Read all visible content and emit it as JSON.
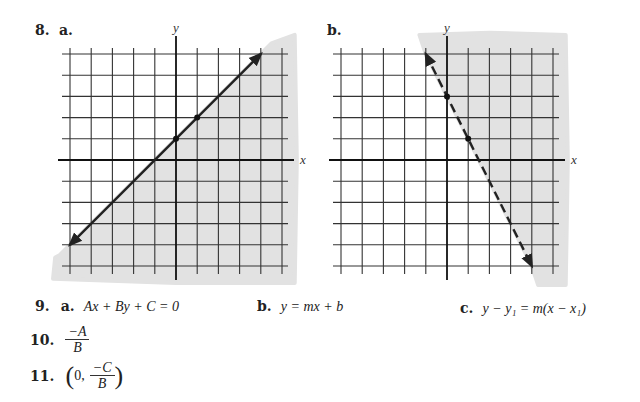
{
  "problem8": {
    "number": "8.",
    "graphs": [
      {
        "label": "a.",
        "x_axis_label": "x",
        "y_axis_label": "y",
        "grid_range": {
          "x": [
            -5,
            5
          ],
          "y": [
            -5,
            5
          ]
        },
        "line": {
          "equation": "y = x + 1",
          "style": "solid",
          "from": [
            -5,
            -4
          ],
          "to": [
            4,
            5
          ]
        },
        "points": [
          [
            0,
            1
          ],
          [
            1,
            2
          ]
        ],
        "shaded_region": "below-right of line",
        "shade_color": "#e2e2e2"
      },
      {
        "label": "b.",
        "x_axis_label": "x",
        "y_axis_label": "y",
        "grid_range": {
          "x": [
            -5,
            5
          ],
          "y": [
            -5,
            5
          ]
        },
        "line": {
          "equation": "y = -2x + 3",
          "style": "dashed",
          "from": [
            -1,
            5
          ],
          "to": [
            4,
            -5
          ]
        },
        "points": [
          [
            0,
            3
          ],
          [
            1,
            1
          ]
        ],
        "shaded_region": "right of line",
        "shade_color": "#e2e2e2"
      }
    ]
  },
  "problem9": {
    "number": "9.",
    "parts": [
      {
        "label": "a.",
        "expr": "Ax + By + C = 0"
      },
      {
        "label": "b.",
        "expr": "y = mx + b"
      },
      {
        "label": "c.",
        "expr": "y − y₁ = m(x − x₁)"
      }
    ]
  },
  "problem10": {
    "number": "10.",
    "numerator": "−A",
    "denominator": "B"
  },
  "problem11": {
    "number": "11.",
    "open": "(",
    "first": "0,",
    "numerator": "−C",
    "denominator": "B",
    "close": ")"
  },
  "chart_data": [
    {
      "type": "line",
      "title": "8a",
      "xlabel": "x",
      "ylabel": "y",
      "xlim": [
        -5,
        5
      ],
      "ylim": [
        -5,
        5
      ],
      "grid": true,
      "series": [
        {
          "name": "y = x + 1",
          "x": [
            -5,
            4
          ],
          "y": [
            -4,
            5
          ],
          "style": "solid"
        }
      ],
      "points": [
        [
          0,
          1
        ],
        [
          1,
          2
        ]
      ],
      "shading": "y < x + 1"
    },
    {
      "type": "line",
      "title": "8b",
      "xlabel": "x",
      "ylabel": "y",
      "xlim": [
        -5,
        5
      ],
      "ylim": [
        -5,
        5
      ],
      "grid": true,
      "series": [
        {
          "name": "y = -2x + 3",
          "x": [
            -1,
            4
          ],
          "y": [
            5,
            -5
          ],
          "style": "dashed"
        }
      ],
      "points": [
        [
          0,
          3
        ],
        [
          1,
          1
        ]
      ],
      "shading": "y > -2x + 3"
    }
  ]
}
